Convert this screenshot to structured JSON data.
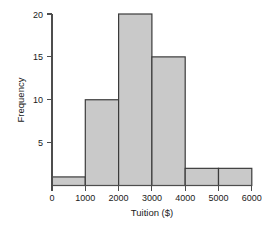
{
  "chart_data": {
    "type": "bar",
    "title": "",
    "subtitle": "",
    "xlabel": "Tuition ($)",
    "ylabel": "Frequency",
    "categories": [
      "0-1000",
      "1000-2000",
      "2000-3000",
      "3000-4000",
      "4000-5000",
      "5000-6000"
    ],
    "bin_edges": [
      0,
      1000,
      2000,
      3000,
      4000,
      5000,
      6000
    ],
    "values": [
      1,
      10,
      20,
      15,
      2,
      2
    ],
    "xlim": [
      0,
      6000
    ],
    "ylim": [
      0,
      20
    ],
    "x_ticks": [
      0,
      1000,
      2000,
      3000,
      4000,
      5000,
      6000
    ],
    "x_tick_labels": [
      "0",
      "1000",
      "2000",
      "3000",
      "4000",
      "5000",
      "6000"
    ],
    "y_ticks": [
      5,
      10,
      15,
      20
    ],
    "y_tick_labels": [
      "5",
      "10",
      "15",
      "20"
    ],
    "grid": false,
    "legend": null,
    "legend_position": "none",
    "bar_fill_color": "#c9c9c9",
    "bar_edge_color": "#3b3b3b",
    "axis_color": "#4d4d4d",
    "text_color": "#1a1a1a",
    "background_color": "#ffffff"
  },
  "axes": {
    "x_title": "Tuition ($)",
    "y_title": "Frequency"
  },
  "x_tick_labels": {
    "t0": "0",
    "t1": "1000",
    "t2": "2000",
    "t3": "3000",
    "t4": "4000",
    "t5": "5000",
    "t6": "6000"
  },
  "y_tick_labels": {
    "t5": "5",
    "t10": "10",
    "t15": "15",
    "t20": "20"
  }
}
